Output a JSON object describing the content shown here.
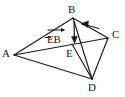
{
  "figure": {
    "type": "geometry-vector-diagram",
    "background_color": "#ffffff",
    "stroke_color": "#1a1a1a",
    "text_color": "#1a1a1a"
  },
  "vertices": [
    {
      "id": "A",
      "label": "A",
      "x": 14,
      "y": 55
    },
    {
      "id": "B",
      "label": "B",
      "x": 73,
      "y": 17
    },
    {
      "id": "C",
      "label": "C",
      "x": 108,
      "y": 38
    },
    {
      "id": "D",
      "label": "D",
      "x": 92,
      "y": 80
    },
    {
      "id": "E",
      "label": "E",
      "x": 72,
      "y": 45
    }
  ],
  "edges": [
    {
      "name": "edge-A-B",
      "from": "A",
      "to": "B"
    },
    {
      "name": "edge-A-C",
      "from": "A",
      "to": "C"
    },
    {
      "name": "edge-A-D",
      "from": "A",
      "to": "D"
    },
    {
      "name": "edge-B-C",
      "from": "B",
      "to": "C"
    },
    {
      "name": "edge-B-D",
      "from": "B",
      "to": "D"
    },
    {
      "name": "edge-C-D",
      "from": "C",
      "to": "D"
    },
    {
      "name": "edge-E-D",
      "from": "E",
      "to": "D"
    }
  ],
  "vectors": [
    {
      "name": "vector-E-to-B",
      "label": "EB",
      "has_overbar_arrow": true,
      "from": "E",
      "to": "B",
      "arrowhead_at": "B"
    },
    {
      "name": "vector-B-downward",
      "label": "",
      "from": "B",
      "to": "E",
      "arrowhead_at": "E"
    },
    {
      "name": "vector-C-to-B",
      "label": "",
      "from": "C",
      "to": "B",
      "arrowhead_at": "B"
    }
  ],
  "labels": {
    "A": "A",
    "B": "B",
    "C": "C",
    "D": "D",
    "E": "E",
    "vector_eb": "EB"
  }
}
